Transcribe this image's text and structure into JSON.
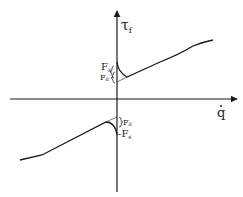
{
  "diagram": {
    "type": "friction-model-plot",
    "y_axis": {
      "symbol": "τ",
      "subscript": "f"
    },
    "x_axis": {
      "symbol": "q",
      "accent": "dot"
    },
    "labels": {
      "upper_static": {
        "symbol": "F",
        "subscript": "s"
      },
      "upper_dynamic": {
        "symbol": "F",
        "subscript": "d"
      },
      "lower_dynamic": {
        "symbol": "F",
        "subscript": "d"
      },
      "lower_static": {
        "symbol": "-F",
        "subscript": "s"
      }
    },
    "colors": {
      "stroke": "#1a1a1a",
      "background": "#ffffff"
    }
  }
}
